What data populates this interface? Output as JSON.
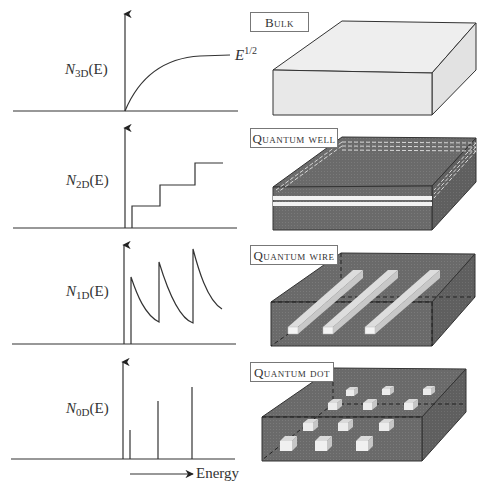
{
  "figure": {
    "panels": [
      {
        "id": "bulk",
        "tag": "Bulk",
        "ylabel_symbol": "N",
        "ylabel_sub": "3D",
        "ylabel_arg": "(E)",
        "curve_annotation_base": "E",
        "curve_annotation_exp": "1/2",
        "curve": "sqrt"
      },
      {
        "id": "quantum-well",
        "tag": "Quantum well",
        "ylabel_symbol": "N",
        "ylabel_sub": "2D",
        "ylabel_arg": "(E)",
        "curve": "staircase"
      },
      {
        "id": "quantum-wire",
        "tag": "Quantum wire",
        "ylabel_symbol": "N",
        "ylabel_sub": "1D",
        "ylabel_arg": "(E)",
        "curve": "inverse-sqrt-spikes"
      },
      {
        "id": "quantum-dot",
        "tag": "Quantum dot",
        "ylabel_symbol": "N",
        "ylabel_sub": "0D",
        "ylabel_arg": "(E)",
        "curve": "delta-functions"
      }
    ],
    "xaxis_label": "Energy"
  },
  "colors": {
    "line": "#333333",
    "bulk_fill": "#ececec",
    "semiconductor_fill": "#6e6e6e",
    "nanostructure_fill": "#e8e8e8"
  }
}
